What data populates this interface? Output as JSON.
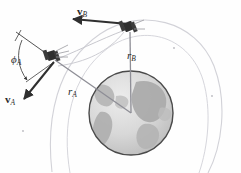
{
  "figure": {
    "name": "two-satellite-orbit-diagram",
    "background_color": "#fefefe",
    "width": 241,
    "height": 173
  },
  "labels": {
    "velocity_b": {
      "symbol": "v",
      "subscript": "B",
      "bold": true
    },
    "velocity_a": {
      "symbol": "v",
      "subscript": "A",
      "bold": true
    },
    "radius_b": {
      "symbol": "r",
      "subscript": "B",
      "bold": false
    },
    "radius_a": {
      "symbol": "r",
      "subscript": "A",
      "bold": false
    },
    "flight_path_angle_a": {
      "symbol": "ϕ",
      "subscript": "A",
      "bold": false
    }
  },
  "colors": {
    "line_dark": "#3a3a3a",
    "orbit_faint": "#cfcfd4",
    "radius_line": "#8a8a92",
    "earth_outline": "#4a4a4a",
    "earth_ocean": "#dcdcdc",
    "earth_land": "#b4b4b4",
    "satellite_body": "#2f2f2f",
    "label_text": "#2a2a2a"
  },
  "elements": {
    "earth": {
      "name": "earth-globe",
      "cx": 131,
      "cy": 113,
      "r": 42
    },
    "satellite_a": {
      "name": "satellite-a",
      "x": 51,
      "y": 57
    },
    "satellite_b": {
      "name": "satellite-b",
      "x": 128,
      "y": 27
    },
    "orbit_inner": {
      "name": "orbit-inner-arc"
    },
    "orbit_outer": {
      "name": "orbit-outer-arc"
    },
    "orbit_transfer": {
      "name": "orbit-transfer-arc"
    },
    "angle_arc": {
      "name": "flight-path-angle-arc"
    },
    "local_horizon_a": {
      "name": "local-horizon-line-a"
    }
  }
}
